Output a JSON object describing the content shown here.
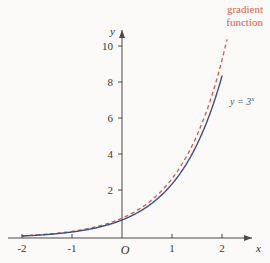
{
  "figure": {
    "background_color": "#fbfaf8",
    "axis_color": "#4a4a4a"
  },
  "annotations": {
    "gradient_label_line1": "gradient",
    "gradient_label_line2": "function",
    "gradient_label_color": "#d4614e",
    "curve_label_base": "y = 3",
    "curve_label_exponent": "x",
    "curve_label_color": "#4a5a78",
    "origin_label": "O"
  },
  "chart_data": {
    "type": "line",
    "title": "",
    "xlabel": "x",
    "ylabel": "y",
    "xlim": [
      -2,
      2.2
    ],
    "ylim": [
      0,
      11.5
    ],
    "xticks": [
      -2,
      -1,
      0,
      1,
      2
    ],
    "xtick_labels": [
      "-2",
      "-1",
      "O",
      "1",
      "2"
    ],
    "yticks": [
      2,
      4,
      6,
      8,
      10
    ],
    "ytick_labels": [
      "2",
      "4",
      "6",
      "8",
      "10"
    ],
    "grid": false,
    "legend": "inline-annotations",
    "series": [
      {
        "name": "y = 3^x",
        "style": "solid",
        "color": "#3b5180",
        "label_text": "y = 3",
        "x": [
          -2,
          -1.8,
          -1.6,
          -1.4,
          -1.2,
          -1,
          -0.8,
          -0.6,
          -0.4,
          -0.2,
          0,
          0.2,
          0.4,
          0.6,
          0.8,
          1,
          1.2,
          1.4,
          1.6,
          1.8,
          2
        ],
        "y": [
          0.111,
          0.145,
          0.19,
          0.249,
          0.326,
          0.333,
          0.482,
          0.481,
          0.642,
          0.803,
          1,
          1.246,
          1.552,
          1.933,
          2.408,
          3,
          3.737,
          4.656,
          5.8,
          7.225,
          9
        ]
      },
      {
        "name": "gradient function",
        "style": "dashed",
        "color": "#d4614e",
        "label_text": "gradient function",
        "x": [
          -2,
          -1.8,
          -1.6,
          -1.4,
          -1.2,
          -1,
          -0.8,
          -0.6,
          -0.4,
          -0.2,
          0,
          0.2,
          0.4,
          0.6,
          0.8,
          1,
          1.2,
          1.4,
          1.6,
          1.8,
          2,
          2.1
        ],
        "y": [
          0.122,
          0.159,
          0.209,
          0.273,
          0.358,
          0.366,
          0.529,
          0.528,
          0.705,
          0.882,
          1.099,
          1.369,
          1.705,
          2.124,
          2.645,
          3.296,
          4.105,
          5.115,
          6.372,
          7.937,
          9.888,
          11.0
        ]
      }
    ]
  }
}
